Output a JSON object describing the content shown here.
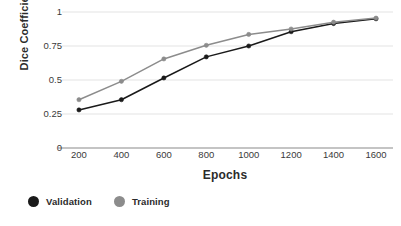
{
  "chart_data": {
    "type": "line",
    "title": "",
    "xlabel": "Epochs",
    "ylabel": "Dice Coefficient",
    "x": [
      200,
      400,
      600,
      800,
      1000,
      1200,
      1400,
      1600
    ],
    "categories": [
      "200",
      "400",
      "600",
      "800",
      "1000",
      "1200",
      "1400",
      "1600"
    ],
    "xlim": [
      120,
      1680
    ],
    "ylim": [
      0,
      1
    ],
    "yticks": [
      0,
      0.25,
      0.5,
      0.75,
      1
    ],
    "ytick_labels": [
      "0",
      "0.25",
      "0.5",
      "0.75",
      "1"
    ],
    "grid": "horizontal",
    "legend_position": "bottom-left",
    "markers": "circle",
    "series": [
      {
        "name": "Validation",
        "color": "#1a1a1a",
        "values": [
          0.28,
          0.355,
          0.515,
          0.67,
          0.75,
          0.855,
          0.915,
          0.95
        ]
      },
      {
        "name": "Training",
        "color": "#8c8c8c",
        "values": [
          0.355,
          0.49,
          0.655,
          0.755,
          0.835,
          0.875,
          0.925,
          0.955
        ]
      }
    ]
  },
  "legend": {
    "items": [
      {
        "label": "Validation",
        "color": "#1a1a1a",
        "icon": "circle-marker-icon"
      },
      {
        "label": "Training",
        "color": "#8c8c8c",
        "icon": "circle-marker-icon"
      }
    ]
  },
  "axis_colors": {
    "grid": "#e3e3e3",
    "axis": "#8a8a8a",
    "tick_text": "#3a3a3a"
  }
}
